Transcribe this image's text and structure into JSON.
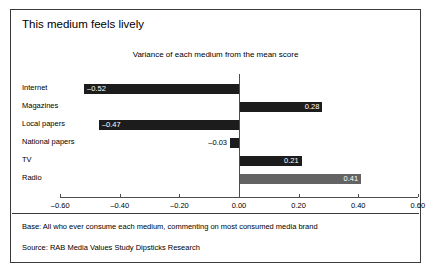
{
  "slide": {
    "title": "This medium feels lively",
    "notes": {
      "base": "Base: All who ever consume each medium, commenting on most consumed media brand",
      "source": "Source: RAB Media Values Study Dipsticks Research"
    }
  },
  "chart_data": {
    "type": "bar",
    "orientation": "horizontal",
    "title": "Variance of each medium from the mean score",
    "xlabel": "",
    "ylabel": "",
    "categories": [
      "Internet",
      "Magazines",
      "Local papers",
      "National papers",
      "TV",
      "Radio"
    ],
    "values": [
      -0.52,
      0.28,
      -0.47,
      -0.03,
      0.21,
      0.41
    ],
    "value_labels": [
      "–0.52",
      "0.28",
      "–0.47",
      "–0.03",
      "0.21",
      "0.41"
    ],
    "bar_colors": [
      "#1c1c1c",
      "#1c1c1c",
      "#1c1c1c",
      "#1c1c1c",
      "#1c1c1c",
      "#636363"
    ],
    "xlim": [
      -0.6,
      0.6
    ],
    "xticks": [
      -0.6,
      -0.4,
      -0.2,
      0.0,
      0.2,
      0.4,
      0.6
    ],
    "xtick_labels": [
      "–0.60",
      "–0.40",
      "–0.20",
      "0.00",
      "0.20",
      "0.40",
      "0.60"
    ],
    "grid": false,
    "legend": "none",
    "zero_reference_line": true
  }
}
